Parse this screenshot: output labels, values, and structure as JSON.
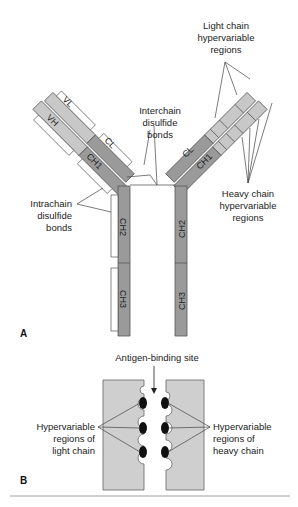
{
  "panel_a": {
    "letter": "A",
    "segments": {
      "vl": "VL",
      "vh": "VH",
      "cl_left": "CL",
      "ch1_left": "CH1",
      "cl_right": "CL",
      "ch1_right": "CH1",
      "ch2_left": "CH2",
      "ch3_left": "CH3",
      "ch2_right": "CH2",
      "ch3_right": "CH3"
    },
    "labels": {
      "light_hv": [
        "Light chain",
        "hypervariable",
        "regions"
      ],
      "interchain": [
        "Interchain",
        "disulfide",
        "bonds"
      ],
      "intrachain": [
        "Intrachain",
        "disulfide",
        "bonds"
      ],
      "heavy_hv": [
        "Heavy chain",
        "hypervariable",
        "regions"
      ]
    }
  },
  "panel_b": {
    "letter": "B",
    "labels": {
      "antigen_site": "Antigen-binding site",
      "light_hv": [
        "Hypervariable",
        "regions of",
        "light chain"
      ],
      "heavy_hv": [
        "Hypervariable",
        "regions of",
        "heavy chain"
      ]
    }
  },
  "colors": {
    "constant": "#9a9a9a",
    "variable": "#c8c8c8",
    "hv_block": "#bdbdbd",
    "panel_b_fill": "#cfcfcf",
    "outline": "#555555",
    "hv_dot": "#111111"
  }
}
